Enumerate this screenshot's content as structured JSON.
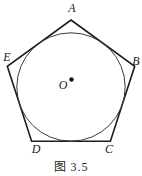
{
  "figure": {
    "labels": {
      "A": "A",
      "B": "B",
      "C": "C",
      "D": "D",
      "E": "E",
      "O": "O"
    },
    "caption": "图 3.5",
    "shapes": [
      "pentagon",
      "inscribed-circle",
      "center-dot"
    ],
    "colors": {
      "pentagon_stroke": "#1c1c1c",
      "circle_stroke": "#3c3c3c",
      "dot_fill": "#111111",
      "text": "#1b1b1b",
      "background": "#ffffff"
    }
  }
}
